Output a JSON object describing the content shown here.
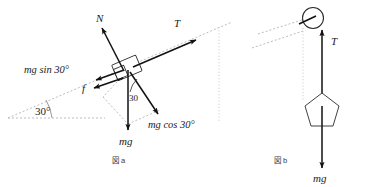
{
  "figure": {
    "background_color": "#ffffff",
    "ink_color": "#111111",
    "guide_color": "#b4b4b4"
  },
  "panel_a": {
    "caption": "図 a",
    "incline_angle_label": "30°",
    "inner_angle_label": "30",
    "labels": {
      "normal": "N",
      "tension": "T",
      "friction": "f",
      "weight": "mg",
      "weight_parallel": "mg sin 30°",
      "weight_perpendicular": "mg cos 30°"
    },
    "vectors": [
      {
        "name": "normal-force",
        "symbol": "N",
        "direction": "up-left perpendicular to incline"
      },
      {
        "name": "tension-force",
        "symbol": "T",
        "direction": "up-right along incline"
      },
      {
        "name": "friction-force",
        "symbol": "f",
        "direction": "down-left along incline"
      },
      {
        "name": "weight-force",
        "symbol": "mg",
        "direction": "straight down"
      },
      {
        "name": "weight-parallel-component",
        "symbol": "mg sin 30°",
        "direction": "down-left along incline"
      },
      {
        "name": "weight-perpendicular-component",
        "symbol": "mg cos 30°",
        "direction": "down-right into incline"
      }
    ]
  },
  "panel_b": {
    "caption": "図 b",
    "labels": {
      "tension": "T",
      "weight": "mg"
    },
    "vectors": [
      {
        "name": "tension-force",
        "symbol": "T",
        "direction": "straight up"
      },
      {
        "name": "weight-force",
        "symbol": "mg",
        "direction": "straight down"
      }
    ],
    "objects": [
      {
        "name": "pulley",
        "shape": "circle"
      },
      {
        "name": "hanging-mass",
        "shape": "pentagon"
      }
    ]
  }
}
